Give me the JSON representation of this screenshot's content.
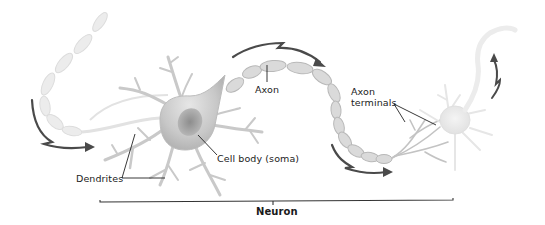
{
  "diagram": {
    "title": "Neuron",
    "labels": {
      "axon": "Axon",
      "axon_terminals_line1": "Axon",
      "axon_terminals_line2": "terminals",
      "cell_body": "Cell body (soma)",
      "dendrites": "Dendrites",
      "neuron": "Neuron"
    },
    "colors": {
      "background": "#ffffff",
      "structure_fill": "#d9d9d9",
      "structure_stroke": "#bdbdbd",
      "soma_fill": "#cfcfcf",
      "nucleus_fill": "#a9a9a9",
      "arrow": "#4a4a4a",
      "leader_line": "#222222",
      "label_text": "#222222"
    },
    "arrows": [
      {
        "name": "signal-arrow-left-in",
        "direction": "down-right"
      },
      {
        "name": "signal-arrow-top-axon",
        "direction": "right"
      },
      {
        "name": "signal-arrow-bottom-axon",
        "direction": "right"
      },
      {
        "name": "signal-arrow-right-out",
        "direction": "up"
      }
    ]
  }
}
